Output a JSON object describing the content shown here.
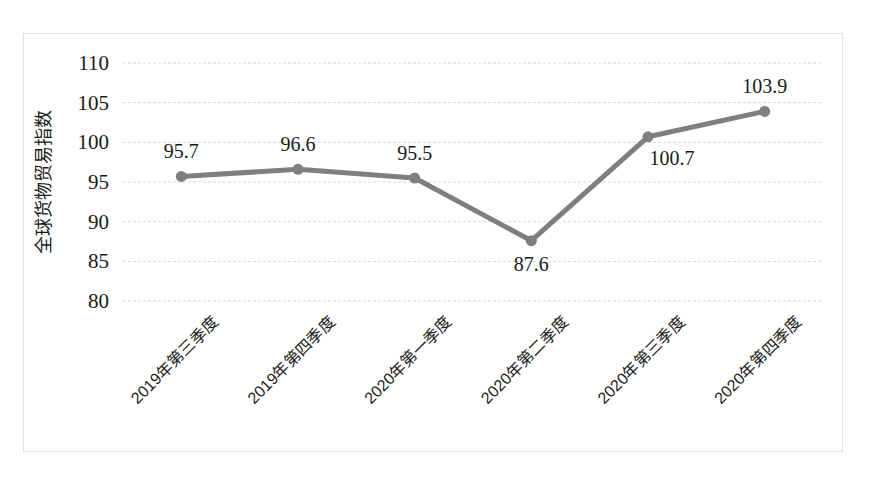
{
  "chart_data": {
    "type": "line",
    "title": "",
    "xlabel": "",
    "ylabel": "全球货物贸易指数",
    "categories": [
      "2019年第三季度",
      "2019年第四季度",
      "2020年第一季度",
      "2020年第二季度",
      "2020年第三季度",
      "2020年第四季度"
    ],
    "values": [
      95.7,
      96.6,
      95.5,
      87.6,
      100.7,
      103.9
    ],
    "value_labels": [
      "95.7",
      "96.6",
      "95.5",
      "87.6",
      "100.7",
      "103.9"
    ],
    "ylim": [
      80,
      110
    ],
    "yticks": [
      80,
      85,
      90,
      95,
      100,
      105,
      110
    ],
    "ytick_labels": [
      "80",
      "85",
      "90",
      "95",
      "100",
      "105",
      "110"
    ],
    "grid": true,
    "legend": "none",
    "series_color": "#7f7f7f",
    "gridline_color": "#d9d9d9",
    "border_color": "#e2e2e2",
    "marker": "circle",
    "label_positions": [
      "above",
      "above",
      "above",
      "below",
      "below-right",
      "above"
    ]
  }
}
